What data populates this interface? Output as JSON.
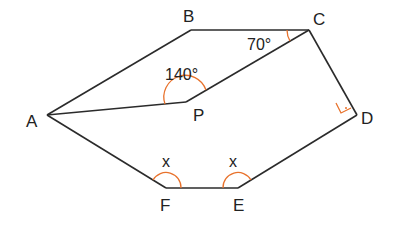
{
  "diagram": {
    "type": "geometry-polygon",
    "vertices": {
      "A": "A",
      "B": "B",
      "C": "C",
      "D": "D",
      "E": "E",
      "F": "F",
      "P": "P"
    },
    "angles": {
      "APC": "140°",
      "BCP": "70°",
      "F": "x",
      "E": "x",
      "D": "right-angle"
    },
    "colors": {
      "line": "#2b2b2b",
      "angle_marker": "#e8722c"
    }
  }
}
